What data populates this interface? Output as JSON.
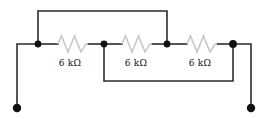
{
  "diagram": {
    "colors": {
      "background": "#ffffff",
      "wire": "#2b2b2b",
      "node": "#111111",
      "resistor": "#c9c9c9",
      "label_text": "#111111"
    },
    "resistors": [
      {
        "id": "R1",
        "label": "6 kΩ",
        "value": 6,
        "unit": "kΩ"
      },
      {
        "id": "R2",
        "label": "6 kΩ",
        "value": 6,
        "unit": "kΩ"
      },
      {
        "id": "R3",
        "label": "6 kΩ",
        "value": 6,
        "unit": "kΩ"
      }
    ],
    "nodes": [
      {
        "id": "N1",
        "x": 38,
        "y": 44
      },
      {
        "id": "N2",
        "x": 104,
        "y": 44
      },
      {
        "id": "N3",
        "x": 167,
        "y": 44
      },
      {
        "id": "N4",
        "x": 233,
        "y": 44
      }
    ],
    "terminals": [
      {
        "id": "T-left",
        "x": 17,
        "y": 108
      },
      {
        "id": "T-right",
        "x": 251,
        "y": 108
      }
    ],
    "wires": [
      {
        "id": "top-bypass",
        "from": "N1",
        "to": "N3",
        "route": "up-over",
        "y": 11
      },
      {
        "id": "bottom-bypass",
        "from": "N2",
        "to": "N4",
        "route": "down-under",
        "y": 81
      },
      {
        "id": "left-lead",
        "from": "N1",
        "to": "T-left",
        "x": 17
      },
      {
        "id": "right-lead",
        "from": "N4",
        "to": "T-right",
        "x": 251
      }
    ]
  }
}
